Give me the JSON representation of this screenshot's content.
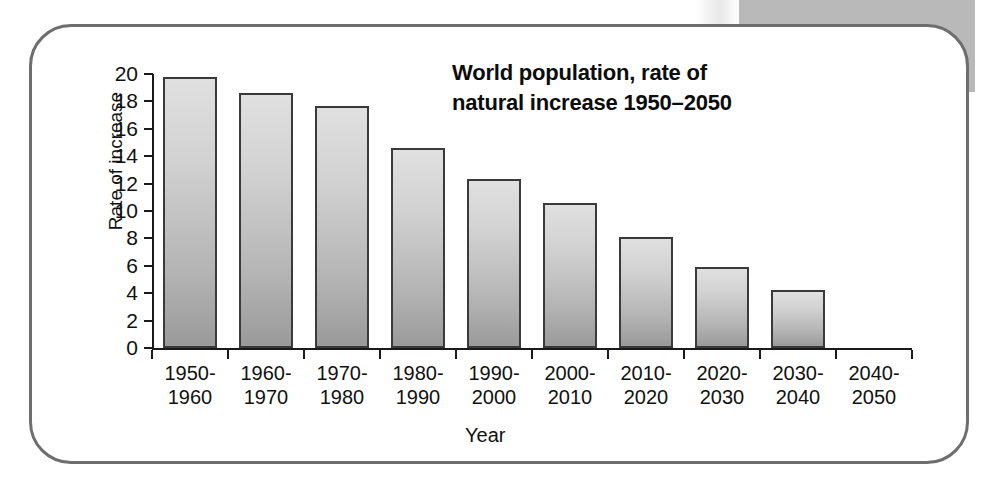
{
  "card": {
    "border_color": "#6e6e6e",
    "background": "#ffffff"
  },
  "decoration": {
    "page_band_color": "#b9b9b9"
  },
  "chart_data": {
    "type": "bar",
    "title": "World population, rate of natural increase 1950–2050",
    "title_line1": "World population, rate of",
    "title_line2": "natural increase 1950–2050",
    "xlabel": "Year",
    "ylabel": "Rate of increase",
    "ylim": [
      0,
      20
    ],
    "ytick_values": [
      0,
      2,
      4,
      6,
      8,
      10,
      12,
      14,
      16,
      18,
      20
    ],
    "ytick_labels": [
      "0",
      "2",
      "4",
      "6",
      "8",
      "10",
      "12",
      "14",
      "16",
      "18",
      "20"
    ],
    "grid": false,
    "legend": "none",
    "categories": [
      "1950–1960",
      "1960–1970",
      "1970–1980",
      "1980–1990",
      "1990–2000",
      "2000–2010",
      "2010–2020",
      "2020–2030",
      "2030–2040",
      "2040–2050"
    ],
    "category_lines": [
      [
        "1950-",
        "1960"
      ],
      [
        "1960-",
        "1970"
      ],
      [
        "1970-",
        "1980"
      ],
      [
        "1980-",
        "1990"
      ],
      [
        "1990-",
        "2000"
      ],
      [
        "2000-",
        "2010"
      ],
      [
        "2010-",
        "2020"
      ],
      [
        "2020-",
        "2030"
      ],
      [
        "2030-",
        "2040"
      ],
      [
        "2040-",
        "2050"
      ]
    ],
    "values": [
      19.8,
      18.6,
      17.7,
      14.6,
      12.3,
      10.6,
      8.1,
      5.9,
      4.2,
      null
    ],
    "bar_fill_top": "#e0e0e0",
    "bar_fill_bottom": "#9a9a9a",
    "bar_border": "#3a3a3a"
  }
}
